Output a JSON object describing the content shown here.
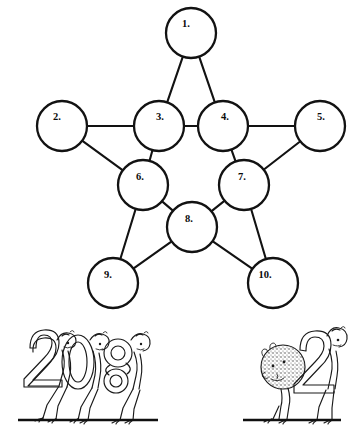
{
  "page": {
    "background_color": "#ffffff",
    "ink_color": "#121212",
    "width": 364,
    "height": 432
  },
  "diagram": {
    "name": "five-pointed-star-network",
    "shape": "pentagram",
    "node_count": 10,
    "stroke_color": "#121212",
    "fill_color": "#ffffff",
    "nodes": [
      {
        "id": 1,
        "label": "1.",
        "cx": 191,
        "cy": 33,
        "r": 25,
        "label_x": 186,
        "label_y": 25
      },
      {
        "id": 2,
        "label": "2.",
        "cx": 62,
        "cy": 126,
        "r": 25,
        "label_x": 57,
        "label_y": 118
      },
      {
        "id": 3,
        "label": "3.",
        "cx": 159,
        "cy": 126,
        "r": 25,
        "label_x": 160,
        "label_y": 118
      },
      {
        "id": 4,
        "label": "4.",
        "cx": 223,
        "cy": 126,
        "r": 25,
        "label_x": 225,
        "label_y": 118
      },
      {
        "id": 5,
        "label": "5.",
        "cx": 320,
        "cy": 126,
        "r": 25,
        "label_x": 321,
        "label_y": 118
      },
      {
        "id": 6,
        "label": "6.",
        "cx": 143,
        "cy": 185,
        "r": 25,
        "label_x": 140,
        "label_y": 178
      },
      {
        "id": 7,
        "label": "7.",
        "cx": 244,
        "cy": 185,
        "r": 25,
        "label_x": 242,
        "label_y": 178
      },
      {
        "id": 8,
        "label": "8.",
        "cx": 192,
        "cy": 227,
        "r": 25,
        "label_x": 189,
        "label_y": 220
      },
      {
        "id": 9,
        "label": "9.",
        "cx": 113,
        "cy": 283,
        "r": 25,
        "label_x": 108,
        "label_y": 276
      },
      {
        "id": 10,
        "label": "10.",
        "cx": 273,
        "cy": 283,
        "r": 25,
        "label_x": 265,
        "label_y": 276
      }
    ],
    "edges": [
      {
        "from": 1,
        "to": 3
      },
      {
        "from": 1,
        "to": 4
      },
      {
        "from": 2,
        "to": 3
      },
      {
        "from": 2,
        "to": 6
      },
      {
        "from": 3,
        "to": 4
      },
      {
        "from": 3,
        "to": 6
      },
      {
        "from": 4,
        "to": 7
      },
      {
        "from": 4,
        "to": 5
      },
      {
        "from": 5,
        "to": 7
      },
      {
        "from": 6,
        "to": 8
      },
      {
        "from": 6,
        "to": 9
      },
      {
        "from": 7,
        "to": 8
      },
      {
        "from": 7,
        "to": 10
      },
      {
        "from": 8,
        "to": 9
      },
      {
        "from": 8,
        "to": 10
      }
    ]
  },
  "illustration": {
    "name": "numeral-creature-cartoon",
    "description": "Walking creature figures whose bodies are numerals",
    "groups": [
      {
        "name": "left-group",
        "figures": [
          {
            "name": "figure-numeral-2",
            "numeral": "2"
          },
          {
            "name": "figure-numeral-0",
            "numeral": "0"
          },
          {
            "name": "figure-numeral-8",
            "numeral": "8"
          }
        ],
        "ground_line": {
          "x1": 18,
          "x2": 158,
          "y": 420
        }
      },
      {
        "name": "right-group",
        "figures": [
          {
            "name": "figure-textured-blob",
            "numeral": "0"
          },
          {
            "name": "figure-numeral-2",
            "numeral": "2"
          }
        ],
        "ground_line": {
          "x1": 243,
          "x2": 341,
          "y": 420
        }
      }
    ]
  }
}
